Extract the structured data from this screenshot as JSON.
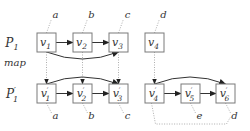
{
  "diagram": {
    "row_labels": {
      "top": {
        "base": "P",
        "sub": "1",
        "prime": false
      },
      "bottom": {
        "base": "P",
        "sub": "1",
        "prime": true
      }
    },
    "map_label": "map",
    "colors": {
      "box_stroke": "#7a7a7a",
      "edge": "#333333",
      "dotted": "#888888",
      "text": "#333333"
    },
    "top_nodes": [
      {
        "id": "v1",
        "base": "v",
        "sub": "1",
        "prime": false,
        "tag": "a"
      },
      {
        "id": "v2",
        "base": "v",
        "sub": "2",
        "prime": false,
        "tag": "b"
      },
      {
        "id": "v3",
        "base": "v",
        "sub": "3",
        "prime": false,
        "tag": "c"
      },
      {
        "id": "v4",
        "base": "v",
        "sub": "4",
        "prime": false,
        "tag": "d"
      }
    ],
    "bottom_nodes": [
      {
        "id": "v1p",
        "base": "v",
        "sub": "1",
        "prime": true,
        "tag": "a"
      },
      {
        "id": "v2p",
        "base": "v",
        "sub": "2",
        "prime": true,
        "tag": "b"
      },
      {
        "id": "v3p",
        "base": "v",
        "sub": "3",
        "prime": true,
        "tag": "c"
      },
      {
        "id": "v4p",
        "base": "v",
        "sub": "4",
        "prime": true,
        "tag": ""
      },
      {
        "id": "v5p",
        "base": "v",
        "sub": "5",
        "prime": true,
        "tag": "e"
      },
      {
        "id": "v6p",
        "base": "v",
        "sub": "6",
        "prime": true,
        "tag": "d"
      }
    ],
    "edges": [
      {
        "from": "v1",
        "to": "v2",
        "style": "straight"
      },
      {
        "from": "v2",
        "to": "v3",
        "style": "straight"
      },
      {
        "from": "v1",
        "to": "v3",
        "style": "curve-below"
      },
      {
        "from": "v1p",
        "to": "v2p",
        "style": "straight"
      },
      {
        "from": "v2p",
        "to": "v3p",
        "style": "straight"
      },
      {
        "from": "v1p",
        "to": "v3p",
        "style": "curve-above"
      },
      {
        "from": "v4p",
        "to": "v5p",
        "style": "straight"
      },
      {
        "from": "v5p",
        "to": "v6p",
        "style": "straight"
      },
      {
        "from": "v4p",
        "to": "v6p",
        "style": "curve-above"
      }
    ],
    "map_edges": [
      {
        "from": "v1",
        "to": "v1p"
      },
      {
        "from": "v2",
        "to": "v2p"
      },
      {
        "from": "v3",
        "to": "v3p"
      },
      {
        "from": "v4",
        "to": "v4p"
      }
    ],
    "dotted_link": {
      "from": "v4p",
      "to": "v6p",
      "route": "below"
    }
  }
}
